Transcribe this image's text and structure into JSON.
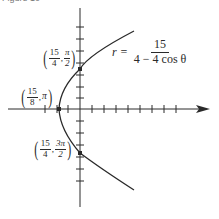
{
  "figure": {
    "caption": "Figure 10",
    "equation": {
      "lhs": "r =",
      "numerator": "15",
      "denominator": "4 − 4 cos θ"
    },
    "points": [
      {
        "name": "top-point",
        "r_num": "15",
        "r_den": "4",
        "theta_num": "π",
        "theta_den": "2",
        "x": 80,
        "y": 69
      },
      {
        "name": "vertex-point",
        "r_num": "15",
        "r_den": "8",
        "theta": "π",
        "x": 59,
        "y": 109
      },
      {
        "name": "bottom-point",
        "r_num": "15",
        "r_den": "4",
        "theta_num": "3π",
        "theta_den": "2",
        "x": 80,
        "y": 153
      }
    ],
    "colors": {
      "curve": "#2a2a2a",
      "axis": "#2a2a2a",
      "background": "#ffffff"
    }
  }
}
